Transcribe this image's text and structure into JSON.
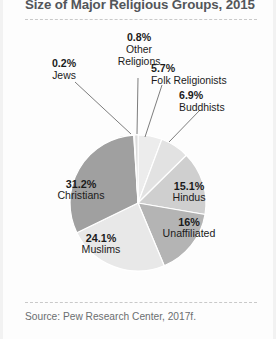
{
  "title": "Size of Major Religious Groups, 2015",
  "source": "Source: Pew Research Center, 2017f.",
  "labels": {
    "other_pct": "0.8%",
    "other_name_1": "Other",
    "other_name_2": "Religions",
    "jews_pct": "0.2%",
    "jews_name": "Jews",
    "folk_pct": "5.7%",
    "folk_name": "Folk Religionists",
    "buddhists_pct": "6.9%",
    "buddhists_name": "Buddhists",
    "christians_pct": "31.2%",
    "christians_name": "Christians",
    "hindus_pct": "15.1%",
    "hindus_name": "Hindus",
    "unaffiliated_pct": "16%",
    "unaffiliated_name": "Unaffiliated",
    "muslims_pct": "24.1%",
    "muslims_name": "Muslims"
  },
  "chart_data": {
    "type": "pie",
    "title": "Size of Major Religious Groups, 2015",
    "unit": "percent",
    "start_angle_deg": 0,
    "direction": "clockwise",
    "legend": "none",
    "labels_position": "inside-and-callout",
    "categories": [
      "Folk Religionists",
      "Buddhists",
      "Hindus",
      "Unaffiliated",
      "Muslims",
      "Christians",
      "Jews",
      "Other Religions"
    ],
    "values": [
      5.7,
      6.9,
      15.1,
      16,
      24.1,
      31.2,
      0.2,
      0.8
    ],
    "display_values": [
      "5.7%",
      "6.9%",
      "15.1%",
      "16%",
      "24.1%",
      "31.2%",
      "0.2%",
      "0.8%"
    ],
    "colors": [
      "#ececec",
      "#e2e2e2",
      "#cfcfcf",
      "#b4b4b4",
      "#e8e8e8",
      "#a0a0a0",
      "#f4f4f4",
      "#dcdcdc"
    ],
    "total": 100.0,
    "source": "Pew Research Center, 2017f."
  },
  "geometry": {
    "cx": 135,
    "cy": 203,
    "r": 68
  },
  "colors": {
    "christians": "#a0a0a0",
    "muslims": "#e8e8e8",
    "unaffiliated": "#b4b4b4",
    "hindus": "#cfcfcf",
    "buddhists": "#e2e2e2",
    "folk": "#ececec",
    "other": "#dcdcdc",
    "jews": "#f4f4f4",
    "stroke": "#ffffff",
    "title": "#53565a",
    "source": "#6b6e70",
    "dash": "#c9c9c9"
  }
}
